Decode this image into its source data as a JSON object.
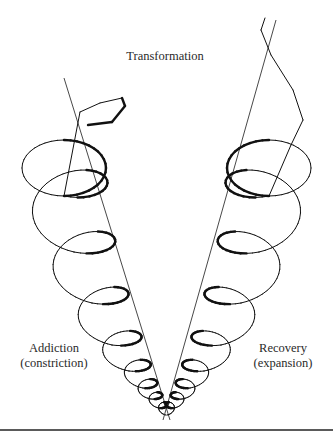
{
  "diagram": {
    "title": "Transformation",
    "left_spiral": {
      "label_line1": "Addiction",
      "label_line2": "(constriction)",
      "meaning": "constriction"
    },
    "right_spiral": {
      "label_line1": "Recovery",
      "label_line2": "(expansion)",
      "meaning": "expansion"
    },
    "colors": {
      "stroke": "#111111",
      "axis": "#333333",
      "text": "#2a2a2a",
      "rule": "#5a5a5a",
      "background": "#ffffff"
    }
  }
}
